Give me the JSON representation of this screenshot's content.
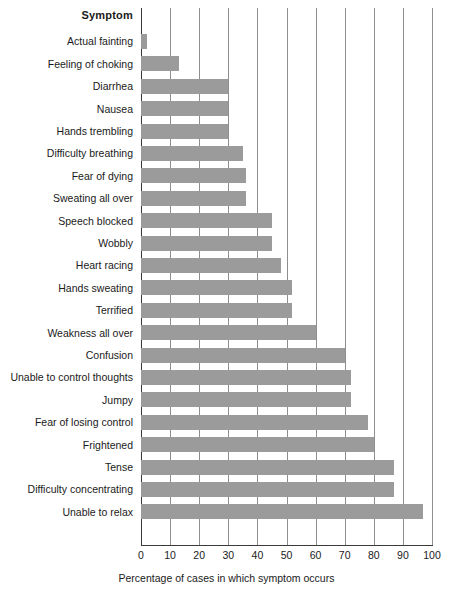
{
  "chart_data": {
    "type": "bar",
    "orientation": "horizontal",
    "title": "",
    "xlabel": "Percentage of cases in which symptom occurs",
    "ylabel": "Symptom",
    "xlim": [
      0,
      100
    ],
    "xticks": [
      0,
      10,
      20,
      30,
      40,
      50,
      60,
      70,
      80,
      90,
      100
    ],
    "grid": "vertical",
    "legend": "none",
    "bar_color": "#9b9b9b",
    "categories": [
      "Actual fainting",
      "Feeling of choking",
      "Diarrhea",
      "Nausea",
      "Hands trembling",
      "Difficulty breathing",
      "Fear of dying",
      "Sweating all over",
      "Speech blocked",
      "Wobbly",
      "Heart racing",
      "Hands sweating",
      "Terrified",
      "Weakness all over",
      "Confusion",
      "Unable to control thoughts",
      "Jumpy",
      "Fear of losing control",
      "Frightened",
      "Tense",
      "Difficulty concentrating",
      "Unable to relax"
    ],
    "values": [
      2,
      13,
      30,
      30,
      30,
      35,
      36,
      36,
      45,
      45,
      48,
      52,
      52,
      60,
      70,
      72,
      72,
      78,
      80,
      87,
      87,
      97
    ]
  },
  "axis": {
    "symptom_header": "Symptom",
    "x_axis_caption": "Percentage of cases in which symptom occurs"
  }
}
